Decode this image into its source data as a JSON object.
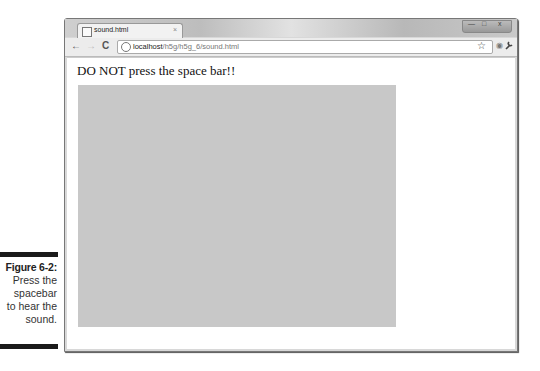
{
  "caption": {
    "figure_label": "Figure 6-2:",
    "lines": [
      "Press the",
      "spacebar",
      "to hear the",
      "sound."
    ]
  },
  "browser": {
    "tab": {
      "title": "sound.html",
      "close_glyph": "×"
    },
    "window_controls": {
      "minimize": "—",
      "maximize": "□",
      "close": "x"
    },
    "nav": {
      "back": "←",
      "forward": "→",
      "reload": "C"
    },
    "address_bar": {
      "host": "localhost",
      "path": "/h5g/h5g_6/sound.html"
    },
    "icons": {
      "star": "☆",
      "eye": "◉",
      "wrench": "🔧"
    }
  },
  "page": {
    "heading": "DO NOT press the space bar!!",
    "canvas_color": "#c8c8c8"
  }
}
